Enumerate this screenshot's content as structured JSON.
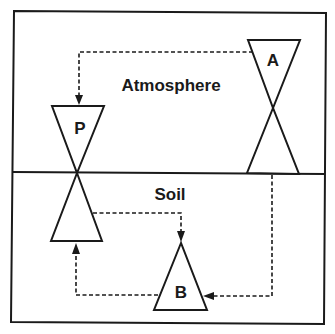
{
  "diagram": {
    "regions": [
      {
        "id": "atmosphere",
        "label": "Atmosphere"
      },
      {
        "id": "soil",
        "label": "Soil"
      }
    ],
    "pools": [
      {
        "id": "P",
        "label": "P"
      },
      {
        "id": "A",
        "label": "A"
      },
      {
        "id": "B",
        "label": "B"
      }
    ],
    "flows": [
      {
        "from": "A",
        "to": "P",
        "style": "dashed"
      },
      {
        "from": "P",
        "to": "B",
        "style": "dashed"
      },
      {
        "from": "B",
        "to": "P",
        "style": "dashed"
      },
      {
        "from": "A",
        "to": "B",
        "style": "dashed"
      }
    ],
    "colors": {
      "ink": "#1a1a1a",
      "background": "#ffffff"
    }
  }
}
